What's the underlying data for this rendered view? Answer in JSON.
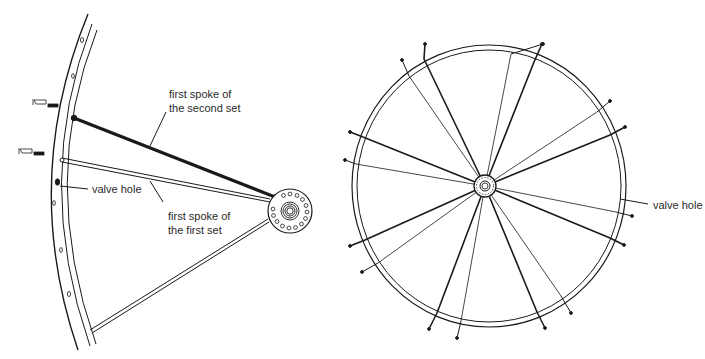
{
  "left_figure": {
    "title": "partial wheel lacing detail",
    "labels": {
      "second_set_line1": "first spoke of",
      "second_set_line2": "the second set",
      "first_set_line1": "first spoke of",
      "first_set_line2": "the first set",
      "valve_hole": "valve hole"
    }
  },
  "right_figure": {
    "title": "fully laced wheel",
    "labels": {
      "valve_hole": "valve hole"
    },
    "spoke_count": 18
  },
  "colors": {
    "ink": "#1a1a1a",
    "background": "#ffffff"
  }
}
